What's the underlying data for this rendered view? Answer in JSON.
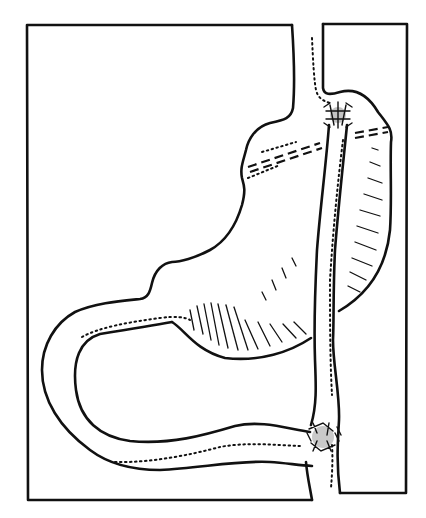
{
  "figure": {
    "background": "#ffffff",
    "ink_color": "#111111",
    "elements": [
      {
        "name": "left-frame-panel",
        "description": "rectangular frame left of esophagus"
      },
      {
        "name": "right-frame-panel",
        "description": "rectangular frame right of esophagus"
      },
      {
        "name": "stomach-outline",
        "description": "stomach pouch with dotted shading"
      },
      {
        "name": "upper-anastomosis",
        "description": "stitched junction at top near esophagus"
      },
      {
        "name": "lower-anastomosis",
        "description": "stitched junction at bottom"
      },
      {
        "name": "bowel-loop",
        "description": "U-shaped intestinal limb"
      },
      {
        "name": "staple-line",
        "description": "double dashed line across stomach"
      }
    ]
  }
}
